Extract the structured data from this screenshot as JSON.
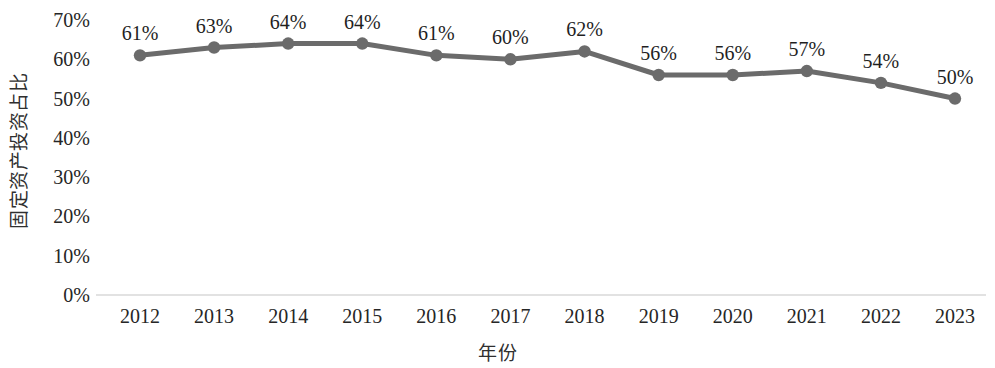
{
  "chart_data": {
    "type": "line",
    "title": "",
    "subtitle": "",
    "xlabel": "年份",
    "ylabel": "固定资产投资占比",
    "categories": [
      "2012",
      "2013",
      "2014",
      "2015",
      "2016",
      "2017",
      "2018",
      "2019",
      "2020",
      "2021",
      "2022",
      "2023"
    ],
    "values": [
      61,
      63,
      64,
      64,
      61,
      60,
      62,
      56,
      56,
      57,
      54,
      50
    ],
    "data_labels": [
      "61%",
      "63%",
      "64%",
      "64%",
      "61%",
      "60%",
      "62%",
      "56%",
      "56%",
      "57%",
      "54%",
      "50%"
    ],
    "ylim": [
      0,
      70
    ],
    "y_ticks": [
      70,
      60,
      50,
      40,
      30,
      20,
      10,
      0
    ],
    "y_tick_labels": [
      "70%",
      "60%",
      "50%",
      "40%",
      "30%",
      "20%",
      "10%",
      "0%"
    ],
    "grid": false,
    "legend": null,
    "legend_position": "none",
    "series": [
      {
        "name": "固定资产投资占比",
        "values": [
          61,
          63,
          64,
          64,
          61,
          60,
          62,
          56,
          56,
          57,
          54,
          50
        ],
        "color": "#6b6b6b",
        "marker": "circle",
        "line_width": 5
      }
    ],
    "colors": {
      "line": "#6b6b6b",
      "marker": "#6b6b6b",
      "axis_line": "#d8d8d8",
      "tick_text": "#262626",
      "axis_title": "#2f2f2f",
      "background": "#ffffff"
    }
  }
}
